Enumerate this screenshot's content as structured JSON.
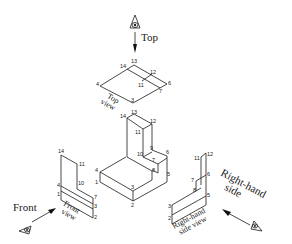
{
  "diagram": {
    "viewer_labels": {
      "top": "Top",
      "front": "Front",
      "right_line1": "Right-hand",
      "right_line2": "side"
    },
    "view_labels": {
      "top_line1": "Top",
      "top_line2": "view",
      "front_line1": "Front",
      "front_line2": "view",
      "right_line1": "Right-hand",
      "right_line2": "side view"
    },
    "top_view_points": {
      "p13": "13",
      "p14": "14",
      "p12": "12",
      "p4": "4",
      "p11": "11",
      "p6": "6",
      "p7": "7",
      "p3": "3"
    },
    "main_points": {
      "p13": "13",
      "p14": "14",
      "p12": "12",
      "p11": "11",
      "p9": "9",
      "p10": "10",
      "p6": "6",
      "p7": "7",
      "p8": "8",
      "p4": "4",
      "p1": "1",
      "p5": "5",
      "p3": "3",
      "p2": "2"
    },
    "front_view_points": {
      "p14": "14",
      "p11": "11",
      "p10": "10",
      "p4": "4",
      "p7": "7",
      "p1": "1",
      "p3": "3",
      "p2": "2"
    },
    "right_view_points": {
      "p11": "11",
      "p12": "12",
      "p6": "6",
      "p7": "7",
      "p8": "8",
      "p5": "5",
      "p3": "3",
      "p2": "2"
    }
  }
}
